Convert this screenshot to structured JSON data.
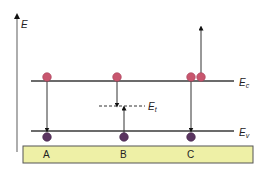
{
  "diagram": {
    "axis": {
      "label": "E"
    },
    "levels": {
      "conduction": {
        "label": "E",
        "subscript": "c"
      },
      "valence": {
        "label": "E",
        "subscript": "v"
      },
      "trap": {
        "label": "E",
        "subscript": "t"
      }
    },
    "columns": [
      {
        "label": "A",
        "description": "band-to-band recombination"
      },
      {
        "label": "B",
        "description": "trap-assisted recombination"
      },
      {
        "label": "C",
        "description": "Auger recombination"
      }
    ],
    "colors": {
      "electron": "#c8566e",
      "hole": "#5a3460",
      "line": "#3a3a3a",
      "axis": "#777777",
      "base_fill": "#eef0a6",
      "base_stroke": "#555555"
    }
  }
}
